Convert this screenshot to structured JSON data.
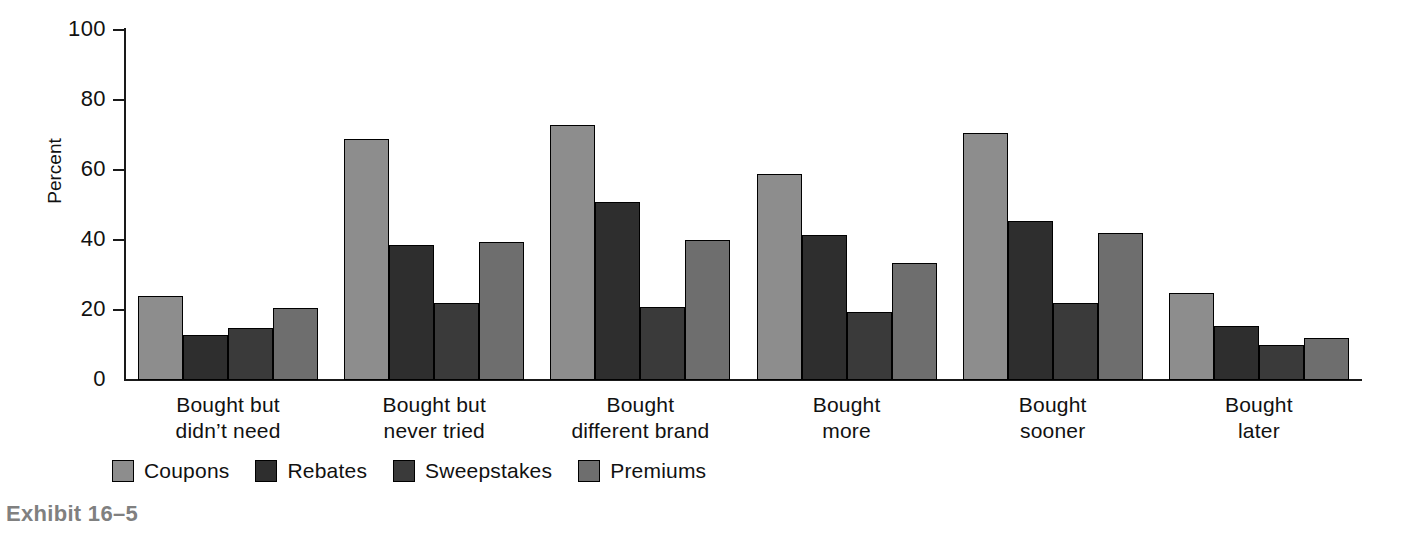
{
  "caption": "Exhibit 16–5",
  "chart_data": {
    "type": "bar",
    "title": "",
    "subtitle": "",
    "xlabel": "",
    "ylabel": "Percent",
    "ylim": [
      0,
      100
    ],
    "yticks": [
      0,
      20,
      40,
      60,
      80,
      100
    ],
    "ytick_labels": [
      "0",
      "20",
      "40",
      "60",
      "80",
      "100"
    ],
    "grid": false,
    "legend_position": "bottom-left",
    "categories": [
      "Bought but\ndidn’t need",
      "Bought but\nnever tried",
      "Bought\ndifferent brand",
      "Bought\nmore",
      "Bought\nsooner",
      "Bought\nlater"
    ],
    "series": [
      {
        "name": "Coupons",
        "color": "#8d8d8d",
        "values": [
          24,
          69,
          73,
          59,
          70.5,
          25
        ]
      },
      {
        "name": "Rebates",
        "color": "#2e2e2e",
        "values": [
          13,
          38.5,
          51,
          41.5,
          45.5,
          15.5
        ]
      },
      {
        "name": "Sweepstakes",
        "color": "#3a3a3a",
        "values": [
          15,
          22,
          21,
          19.5,
          22,
          10
        ]
      },
      {
        "name": "Premiums",
        "color": "#6e6e6e",
        "values": [
          20.5,
          39.5,
          40,
          33.5,
          42,
          12
        ]
      }
    ]
  }
}
